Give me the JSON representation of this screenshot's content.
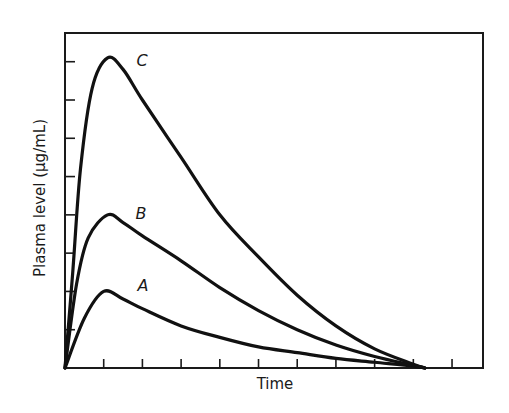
{
  "chart_data": {
    "type": "line",
    "title": "",
    "xlabel": "Time",
    "ylabel": "Plasma level (μg/mL)",
    "x_ticks_count": 10,
    "y_ticks_count": 8,
    "tick_labels_shown": false,
    "xlim": [
      0,
      10.8
    ],
    "ylim": [
      0,
      8.75
    ],
    "grid": false,
    "legend": "inline labels",
    "series": [
      {
        "name": "A",
        "x": [
          0,
          0.5,
          1.0,
          1.5,
          2.0,
          3.0,
          4.0,
          5.0,
          6.0,
          7.0,
          8.0,
          9.0,
          9.3
        ],
        "y": [
          0,
          1.3,
          2.0,
          1.8,
          1.55,
          1.1,
          0.8,
          0.55,
          0.4,
          0.25,
          0.15,
          0.05,
          0
        ]
      },
      {
        "name": "B",
        "x": [
          0,
          0.3,
          0.6,
          1.1,
          1.5,
          2.0,
          3.0,
          4.0,
          5.0,
          6.0,
          7.0,
          8.0,
          9.0,
          9.3
        ],
        "y": [
          0,
          2.2,
          3.4,
          4.0,
          3.8,
          3.45,
          2.8,
          2.1,
          1.5,
          1.0,
          0.6,
          0.3,
          0.07,
          0
        ]
      },
      {
        "name": "C",
        "x": [
          0,
          0.2,
          0.4,
          0.7,
          1.1,
          1.5,
          2.0,
          3.0,
          4.0,
          5.0,
          6.0,
          7.0,
          8.0,
          9.0,
          9.3
        ],
        "y": [
          0,
          2.5,
          5.2,
          7.3,
          8.1,
          7.8,
          7.0,
          5.5,
          4.0,
          2.9,
          1.9,
          1.1,
          0.5,
          0.1,
          0
        ]
      }
    ],
    "annotations": [
      {
        "text": "C",
        "x": 1.9,
        "y": 8.0
      },
      {
        "text": "B",
        "x": 1.9,
        "y": 4.05
      },
      {
        "text": "A",
        "x": 1.95,
        "y": 2.15
      }
    ]
  },
  "labels": {
    "x_axis": "Time",
    "y_axis": "Plasma level (μg/mL)",
    "curve_a": "A",
    "curve_b": "B",
    "curve_c": "C"
  }
}
